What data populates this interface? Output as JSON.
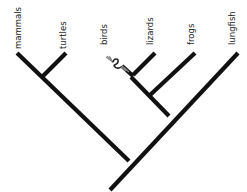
{
  "diagram": {
    "type": "cladogram",
    "taxa": [
      "mammals",
      "turtles",
      "birds",
      "lizards",
      "frogs",
      "lungfish"
    ],
    "labels": {
      "mammals": "mammals",
      "turtles": "turtles",
      "birds": "birds",
      "lizards": "lizards",
      "frogs": "frogs",
      "lungfish": "lungfish"
    },
    "topology": "((mammals, turtles), ((birds, lizards), frogs), lungfish)",
    "colors": {
      "branch": "#111111",
      "label": "#222222",
      "background": "#ffffff"
    },
    "annotations": [
      {
        "near": "birds",
        "description": "tangled squiggle mark on birds branch"
      }
    ]
  }
}
